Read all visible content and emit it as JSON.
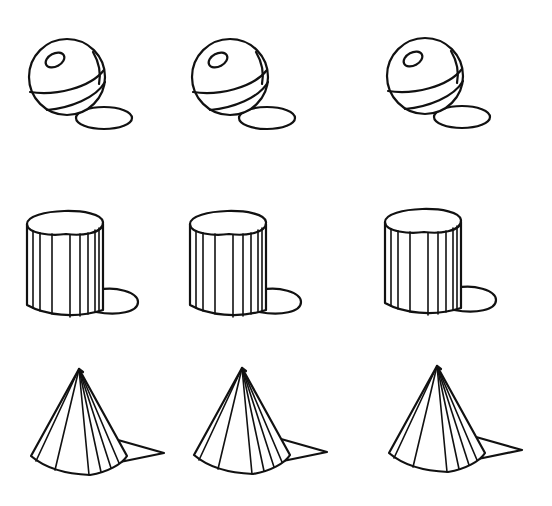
{
  "illustration": {
    "description": "Hand-drawn ink study: three rows of simple forms with cast shadows",
    "background_color": "#ffffff",
    "ink_color": "#111111",
    "rows": [
      {
        "name": "spheres",
        "shape": "sphere-with-bands-and-highlight",
        "count": 3
      },
      {
        "name": "cylinders",
        "shape": "fluted-cylinder",
        "count": 3
      },
      {
        "name": "cones",
        "shape": "faceted-cone",
        "count": 3
      }
    ],
    "column_offsets_x": [
      0,
      163,
      358
    ]
  }
}
